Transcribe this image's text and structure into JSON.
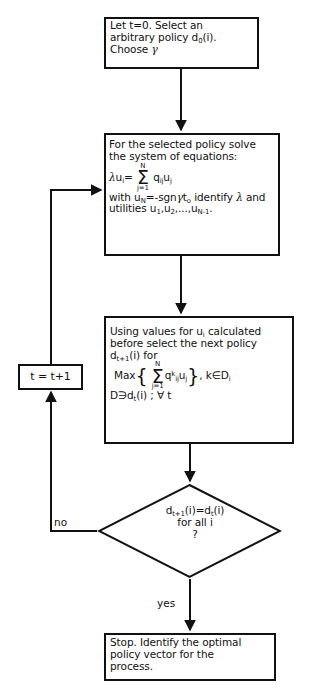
{
  "diagram": {
    "type": "flowchart",
    "stroke_color": "#111111",
    "background_color": "#ffffff"
  },
  "nodes": {
    "start": {
      "shape": "rectangle",
      "line1": "Let t=0. Select an",
      "line2": "arbitrary  policy d",
      "line2_sub": "0",
      "line2_tail": "(i).",
      "line3": "Choose ",
      "line3_symbol": "γ"
    },
    "solve": {
      "shape": "rectangle",
      "line1": "For the selected policy solve",
      "line2": "the system of equations:",
      "eq_lhs_lambda": "λ",
      "eq_lhs_u": "u",
      "eq_lhs_sub": "i",
      "eq_equals": "=",
      "sum_upper": "N",
      "sum_lower": "j=1",
      "sum_symbol": "Σ",
      "eq_q": "q",
      "eq_q_sub": "ij",
      "eq_u": "u",
      "eq_u_sub": "j",
      "line4_a": "with u",
      "line4_a_sub": "N",
      "line4_b": "=-sgn",
      "line4_gamma": "γ",
      "line4_c": "t",
      "line4_c_sub": "o",
      "line4_d": " identify ",
      "line4_lambda": "λ",
      "line4_e": " and",
      "line5_a": "utilities u",
      "line5_a_sub": "1",
      "line5_b": ",u",
      "line5_b_sub": "2",
      "line5_c": ",...,u",
      "line5_c_sub": "N-1",
      "line5_d": "."
    },
    "policy": {
      "shape": "rectangle",
      "line1": "Using values for u",
      "line1_sub": "i",
      "line1_tail": " calculated",
      "line2": "before select the next policy",
      "line3_d": "d",
      "line3_sub": "t+1",
      "line3_tail": "(i) for",
      "line4_max": "Max",
      "line4_brace_open": "{",
      "sum_upper": "N",
      "sum_lower": "j=1",
      "sum_symbol": "Σ",
      "line4_q": "q",
      "line4_q_sup": "k",
      "line4_q_sub": "ij",
      "line4_u": "u",
      "line4_u_sub": "j",
      "line4_brace_close": "}",
      "line4_cond": ",  k∈D",
      "line4_cond_sub": "i",
      "line5_a": "D∋d",
      "line5_a_sub": "t",
      "line5_b": "(i) ; ∀ t"
    },
    "counter": {
      "shape": "rectangle",
      "label": "t = t+1"
    },
    "decision": {
      "shape": "diamond",
      "line1_d": "d",
      "line1_sub": "t+1",
      "line1_mid": "(i)=d",
      "line1_sub2": "t",
      "line1_tail": "(i)",
      "line2": "for all  i",
      "line3": "?"
    },
    "stop": {
      "shape": "rectangle",
      "line1": "Stop. Identify the optimal",
      "line2": "policy vector for the",
      "line3": "process."
    }
  },
  "edges": {
    "no_label": "no",
    "yes_label": "yes"
  }
}
